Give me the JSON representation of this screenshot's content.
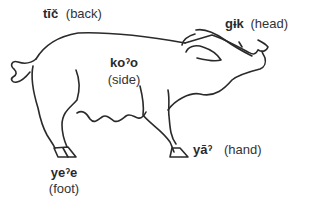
{
  "figure": {
    "line_color": "#2a2a2a",
    "labels": [
      {
        "id": "back",
        "term": "tīč",
        "gloss": "(back)"
      },
      {
        "id": "head",
        "term": "gɨk",
        "gloss": "(head)"
      },
      {
        "id": "side",
        "term": "koˀo",
        "gloss": "(side)"
      },
      {
        "id": "hand",
        "term": "yāˀ",
        "gloss": "(hand)"
      },
      {
        "id": "foot",
        "term": "yeˀe",
        "gloss": "(foot)"
      }
    ]
  }
}
